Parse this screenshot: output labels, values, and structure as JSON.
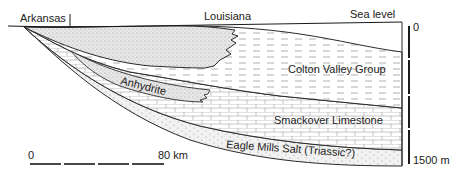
{
  "labels": {
    "arkansas": "Arkansas",
    "louisiana": "Louisiana",
    "sea_level": "Sea level"
  },
  "units": {
    "colton_valley": "Colton Valley Group",
    "anhydrite": "Anhydrite",
    "smackover": "Smackover Limestone",
    "eagle_mills": "Eagle Mills Salt (Triassic?)"
  },
  "depth_scale": {
    "top": "0",
    "bottom": "1500 m"
  },
  "horizontal_scale": {
    "start": "0",
    "end": "80 km"
  },
  "colors": {
    "line": "#2a2a2a",
    "stipple": "#e6e6e6",
    "pattern": "#9a9a9a"
  }
}
